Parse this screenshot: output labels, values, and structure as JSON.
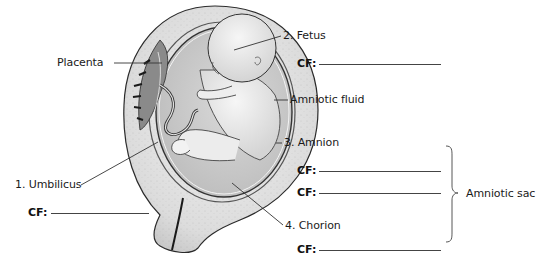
{
  "diagram": {
    "labels": {
      "placenta": "Placenta",
      "fetus": "2. Fetus",
      "amniotic_fluid": "Amniotic fluid",
      "amnion": "3. Amnion",
      "chorion": "4. Chorion",
      "umbilicus": "1. Umbilicus",
      "amniotic_sac": "Amniotic sac"
    },
    "cf_prompt": "CF:",
    "blanks": [
      {
        "id": "fetus-cf",
        "after": "2. Fetus",
        "value": ""
      },
      {
        "id": "amnion-cf-1",
        "after": "3. Amnion",
        "value": ""
      },
      {
        "id": "amnion-cf-2",
        "after": "3. Amnion",
        "value": ""
      },
      {
        "id": "chorion-cf",
        "after": "4. Chorion",
        "value": ""
      },
      {
        "id": "umbilicus-cf",
        "after": "1. Umbilicus",
        "value": ""
      }
    ],
    "colors": {
      "line": "#333333",
      "tissue": "#d9d9d9",
      "fluid": "#c8c8c8",
      "fetus": "#e8e8e8"
    }
  }
}
